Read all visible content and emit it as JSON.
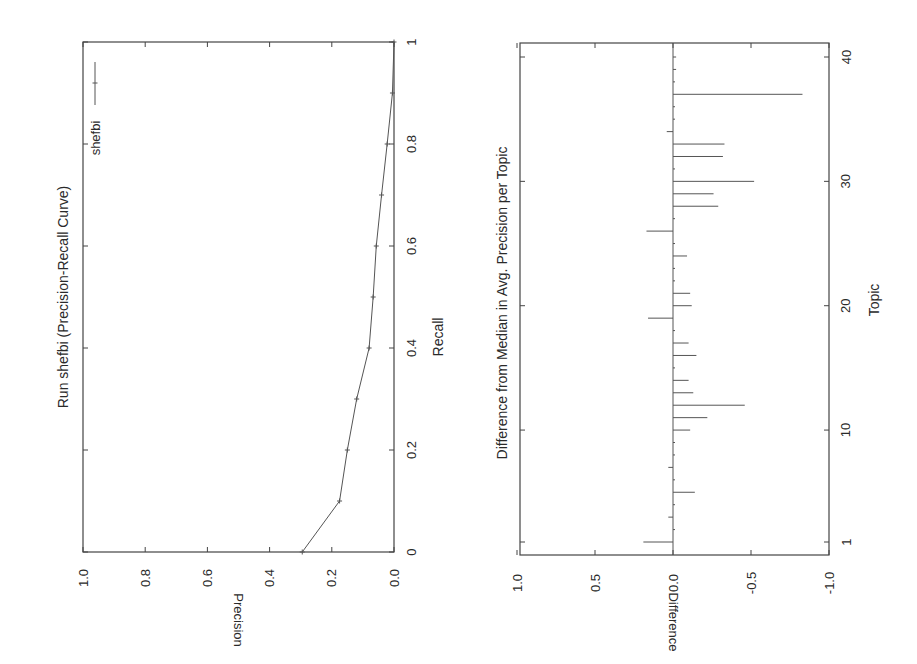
{
  "chart_data": [
    {
      "type": "line",
      "title": "Run shefbi (Precision-Recall Curve)",
      "xlabel": "Recall",
      "ylabel": "Precision",
      "xlim": [
        0,
        1
      ],
      "ylim": [
        0.0,
        1.0
      ],
      "x_ticks": [
        "0",
        "0.2",
        "0.4",
        "0.6",
        "0.8",
        "1"
      ],
      "y_ticks": [
        "0.0",
        "0.2",
        "0.4",
        "0.6",
        "0.8",
        "1.0"
      ],
      "legend": [
        "shefbi"
      ],
      "legend_position": "upper right",
      "grid": false,
      "orientation_note": "page rotated 90 degrees counter-clockwise",
      "series": [
        {
          "name": "shefbi",
          "x": [
            0.0,
            0.1,
            0.2,
            0.3,
            0.4,
            0.5,
            0.6,
            0.7,
            0.8,
            0.9,
            1.0
          ],
          "values": [
            0.295,
            0.175,
            0.15,
            0.12,
            0.08,
            0.067,
            0.057,
            0.04,
            0.022,
            0.005,
            0.0
          ]
        }
      ]
    },
    {
      "type": "bar",
      "title": "Difference from Median in Avg. Precision per Topic",
      "xlabel": "Topic",
      "ylabel": "Difference",
      "xlim": [
        1,
        40
      ],
      "ylim": [
        -1.0,
        1.0
      ],
      "x_ticks": [
        "1",
        "10",
        "20",
        "30",
        "40"
      ],
      "y_ticks": [
        "1.0",
        "0.5",
        "0.0",
        "-0.5",
        "-1.0"
      ],
      "grid": false,
      "orientation_note": "page rotated 90 degrees counter-clockwise",
      "categories": [
        1,
        2,
        3,
        4,
        5,
        6,
        7,
        8,
        9,
        10,
        11,
        12,
        13,
        14,
        15,
        16,
        17,
        18,
        19,
        20,
        21,
        22,
        23,
        24,
        25,
        26,
        27,
        28,
        29,
        30,
        31,
        32,
        33,
        34,
        35,
        36,
        37,
        38,
        39,
        40
      ],
      "values": [
        0.19,
        0.0,
        0.03,
        -0.01,
        -0.14,
        0.0,
        0.03,
        0.0,
        -0.01,
        -0.11,
        -0.22,
        -0.46,
        -0.13,
        -0.1,
        -0.01,
        -0.15,
        -0.1,
        -0.01,
        0.16,
        -0.12,
        -0.11,
        -0.01,
        0.0,
        -0.09,
        0.0,
        0.17,
        0.0,
        -0.29,
        -0.26,
        -0.52,
        -0.01,
        -0.32,
        -0.33,
        0.04,
        0.0,
        -0.01,
        -0.83,
        -0.01,
        -0.02,
        -0.02
      ]
    }
  ],
  "layout": {
    "pr": {
      "left": 83,
      "top": 42,
      "right": 394,
      "bottom": 552
    },
    "diff": {
      "left": 520,
      "top": 43,
      "right": 829,
      "bottom": 555
    }
  }
}
